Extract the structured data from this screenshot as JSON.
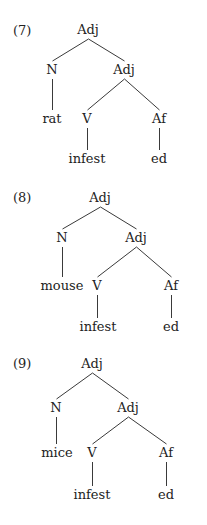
{
  "trees": [
    {
      "number": "(7)",
      "number_pos": [
        13,
        24
      ],
      "nodes": [
        {
          "id": "root",
          "label": "Adj",
          "x": 88,
          "y": 23
        },
        {
          "id": "n",
          "label": "N",
          "x": 52,
          "y": 63
        },
        {
          "id": "adj2",
          "label": "Adj",
          "x": 124,
          "y": 63
        },
        {
          "id": "noun_word",
          "label": "rat",
          "x": 52,
          "y": 112
        },
        {
          "id": "v",
          "label": "V",
          "x": 87,
          "y": 112
        },
        {
          "id": "af",
          "label": "Af",
          "x": 159,
          "y": 112
        },
        {
          "id": "verb_word",
          "label": "infest",
          "x": 87,
          "y": 152
        },
        {
          "id": "affix_word",
          "label": "ed",
          "x": 159,
          "y": 152
        }
      ]
    },
    {
      "number": "(8)",
      "number_pos": [
        13,
        191
      ],
      "nodes": [
        {
          "id": "root",
          "label": "Adj",
          "x": 100,
          "y": 191
        },
        {
          "id": "n",
          "label": "N",
          "x": 62,
          "y": 231
        },
        {
          "id": "adj2",
          "label": "Adj",
          "x": 136,
          "y": 231
        },
        {
          "id": "noun_word",
          "label": "mouse",
          "x": 62,
          "y": 279
        },
        {
          "id": "v",
          "label": "V",
          "x": 97,
          "y": 279
        },
        {
          "id": "af",
          "label": "Af",
          "x": 171,
          "y": 279
        },
        {
          "id": "verb_word",
          "label": "infest",
          "x": 98,
          "y": 320
        },
        {
          "id": "affix_word",
          "label": "ed",
          "x": 171,
          "y": 320
        }
      ]
    },
    {
      "number": "(9)",
      "number_pos": [
        13,
        357
      ],
      "nodes": [
        {
          "id": "root",
          "label": "Adj",
          "x": 92,
          "y": 357
        },
        {
          "id": "n",
          "label": "N",
          "x": 56,
          "y": 401
        },
        {
          "id": "adj2",
          "label": "Adj",
          "x": 128,
          "y": 401
        },
        {
          "id": "noun_word",
          "label": "mice",
          "x": 57,
          "y": 446
        },
        {
          "id": "v",
          "label": "V",
          "x": 92,
          "y": 446
        },
        {
          "id": "af",
          "label": "Af",
          "x": 166,
          "y": 446
        },
        {
          "id": "verb_word",
          "label": "infest",
          "x": 92,
          "y": 488
        },
        {
          "id": "affix_word",
          "label": "ed",
          "x": 166,
          "y": 488
        }
      ]
    }
  ],
  "edges": [
    [
      "root",
      "n"
    ],
    [
      "root",
      "adj2"
    ],
    [
      "n",
      "noun_word"
    ],
    [
      "adj2",
      "v"
    ],
    [
      "adj2",
      "af"
    ],
    [
      "v",
      "verb_word"
    ],
    [
      "af",
      "affix_word"
    ]
  ]
}
